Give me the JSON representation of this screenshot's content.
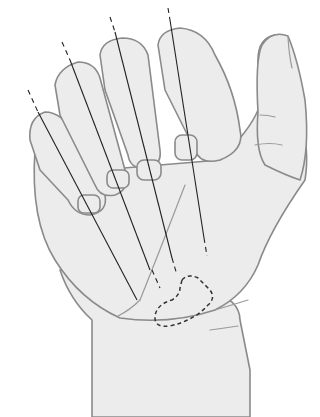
{
  "figure": {
    "elements": {
      "hand": "hand-illustration",
      "projection_lines": 4,
      "dashed_region": "hypothenar/thenar-base outlined area near wrist"
    },
    "colors": {
      "background": "#ffffff",
      "skin": "#ececec",
      "outline": "#8a8a8a",
      "lines": "#222222"
    }
  }
}
